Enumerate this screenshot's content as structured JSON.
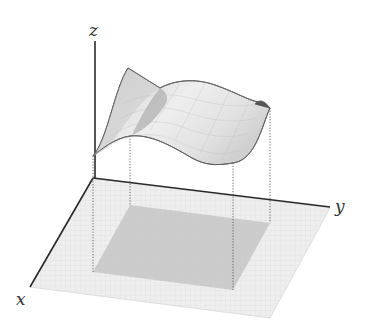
{
  "figure": {
    "axes": {
      "x_label": "x",
      "y_label": "y",
      "z_label": "z"
    },
    "colors": {
      "plane": "#ececec",
      "plane_grid": "#dcdcdc",
      "domain": "#c4c4c4",
      "surface": "#e6e6e6",
      "surface_shadow": "#b8b8b8",
      "underside": "#5a5a5a",
      "axis": "#2a2a2a"
    }
  }
}
